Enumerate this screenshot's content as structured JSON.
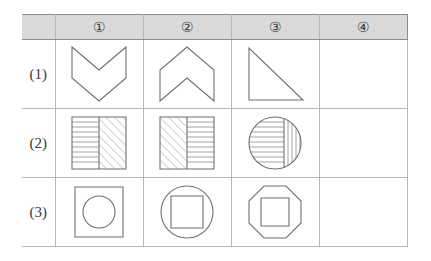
{
  "page": {
    "kind": "visual-analogy-puzzle-grid",
    "background_color": "#ffffff",
    "line_color": "#b9b9bb",
    "shape_stroke_color": "#6f6f72",
    "header_background_color": "#d9d9d9"
  },
  "table": {
    "corner_label": "",
    "column_headers": [
      {
        "label": "①",
        "name": "column-1"
      },
      {
        "label": "②",
        "name": "column-2"
      },
      {
        "label": "③",
        "name": "column-3"
      },
      {
        "label": "④",
        "name": "column-4"
      }
    ],
    "row_labels": [
      {
        "label": "(1)"
      },
      {
        "label": "(2)"
      },
      {
        "label": "(3)"
      }
    ],
    "cells": [
      [
        {
          "shape": "chevron-down",
          "filled": false
        },
        {
          "shape": "chevron-up",
          "filled": false
        },
        {
          "shape": "right-triangle",
          "filled": false
        },
        {
          "shape": "blank",
          "filled": false
        }
      ],
      [
        {
          "shape": "square-horizontal-lines-left-hatch-right",
          "filled": true
        },
        {
          "shape": "square-hatch-left-horizontal-lines-right",
          "filled": true
        },
        {
          "shape": "circle-horizontal-lines-left-vertical-lines-right",
          "filled": true
        },
        {
          "shape": "blank",
          "filled": false
        }
      ],
      [
        {
          "shape": "circle-in-square",
          "filled": false
        },
        {
          "shape": "square-in-circle",
          "filled": false
        },
        {
          "shape": "square-in-octagon",
          "filled": false
        },
        {
          "shape": "blank",
          "filled": false
        }
      ]
    ]
  }
}
